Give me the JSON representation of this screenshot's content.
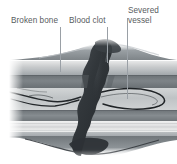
{
  "figure": {
    "background_color": "#ffffff",
    "width": 177,
    "height": 164
  },
  "labels": [
    {
      "id": "broken-bone",
      "text": "Broken bone",
      "color": "#585c60",
      "x": 11,
      "y": 16,
      "leader": {
        "x": 60,
        "y_top": 27,
        "y_bottom": 72,
        "color": "#9aa0a6"
      }
    },
    {
      "id": "blood-clot",
      "text": "Blood clot",
      "color": "#585c60",
      "x": 69,
      "y": 16,
      "leader": {
        "x": 107,
        "y_top": 27,
        "y_bottom": 63,
        "color": "#9aa0a6"
      }
    },
    {
      "id": "severed-vessel",
      "text": "Severed\nvessel",
      "color": "#585c60",
      "x": 128,
      "y": 6,
      "leader": {
        "x": 127,
        "y_top": 18,
        "y_bottom": 99,
        "color": "#9aa0a6"
      }
    }
  ],
  "illustration": {
    "name": "bone-fracture-cross-section",
    "description": "Grayscale anatomical cross-section of a fractured long bone showing tissue layers, a torn blood vessel and a dark blood clot (haematoma) filling the fracture gap.",
    "palette": {
      "periosteum_light": "#d9dadb",
      "soft_tissue_mid": "#9a9ea1",
      "cortical_dark": "#6f7579",
      "marrow_light": "#e6e7e8",
      "clot_dark": "#3c4146",
      "clot_core": "#2b3034",
      "vessel_outline": "#1d2023",
      "band_pale": "#efefef",
      "edge_white": "#fbfbfb"
    },
    "layers": [
      {
        "name": "swelling-dome",
        "y": 44,
        "height": 14,
        "tone": "#8e9498"
      },
      {
        "name": "periosteum-upper",
        "y": 57,
        "height": 7,
        "tone": "#d6d8d9"
      },
      {
        "name": "soft-tissue-upper",
        "y": 64,
        "height": 8,
        "tone": "#b4b8bb"
      },
      {
        "name": "cortical-bone-upper",
        "y": 72,
        "height": 12,
        "tone": "#767c80"
      },
      {
        "name": "medullary-cavity",
        "y": 84,
        "height": 22,
        "tone": "#c9cccd"
      },
      {
        "name": "cortical-bone-lower",
        "y": 106,
        "height": 11,
        "tone": "#7b8084"
      },
      {
        "name": "periosteum-lower",
        "y": 117,
        "height": 10,
        "tone": "#e2e3e4"
      },
      {
        "name": "soft-tissue-lower",
        "y": 127,
        "height": 9,
        "tone": "#aeb2b5"
      },
      {
        "name": "swelling-lower-dome",
        "y": 134,
        "height": 16,
        "tone": "#8a9094"
      }
    ],
    "clot": {
      "name": "blood-clot-mass",
      "orientation": "diagonal",
      "top_x": 100,
      "bottom_x": 72,
      "top_y": 48,
      "bottom_y": 152
    },
    "vessels": [
      {
        "name": "severed-vessel-right",
        "side": "right",
        "y": 95
      },
      {
        "name": "severed-vessel-left",
        "side": "left",
        "y": 96
      }
    ]
  }
}
